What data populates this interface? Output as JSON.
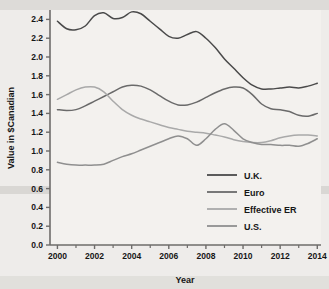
{
  "chart_data": {
    "type": "line",
    "title": "",
    "xlabel": "Year",
    "ylabel": "Value in $Canadian",
    "xlim": [
      1999.6,
      2014.2
    ],
    "ylim": [
      0.0,
      2.5
    ],
    "grid": false,
    "legend_position": "inside-bottom-right",
    "y_ticks": [
      "0.0",
      "0.2",
      "0.4",
      "0.6",
      "0.8",
      "1.0",
      "1.2",
      "1.4",
      "1.6",
      "1.8",
      "2.0",
      "2.2",
      "2.4"
    ],
    "y_tick_values": [
      0.0,
      0.2,
      0.4,
      0.6,
      0.8,
      1.0,
      1.2,
      1.4,
      1.6,
      1.8,
      2.0,
      2.2,
      2.4
    ],
    "x_ticks": [
      "2000",
      "2002",
      "2004",
      "2006",
      "2008",
      "2010",
      "2012",
      "2014"
    ],
    "x_tick_values": [
      2000,
      2002,
      2004,
      2006,
      2008,
      2010,
      2012,
      2014
    ],
    "x_minor_tick_values": [
      2001,
      2003,
      2005,
      2007,
      2009,
      2011,
      2013
    ],
    "x": [
      2000,
      2000.5,
      2001,
      2001.5,
      2002,
      2002.5,
      2003,
      2003.5,
      2004,
      2004.5,
      2005,
      2005.5,
      2006,
      2006.5,
      2007,
      2007.5,
      2008,
      2008.5,
      2009,
      2009.5,
      2010,
      2010.5,
      2011,
      2011.5,
      2012,
      2012.5,
      2013,
      2013.5,
      2014
    ],
    "series": [
      {
        "name": "U.K.",
        "color": "#4a4a4a",
        "values": [
          2.38,
          2.3,
          2.29,
          2.33,
          2.44,
          2.47,
          2.41,
          2.42,
          2.48,
          2.46,
          2.38,
          2.3,
          2.22,
          2.2,
          2.24,
          2.27,
          2.2,
          2.1,
          1.98,
          1.88,
          1.78,
          1.7,
          1.66,
          1.66,
          1.67,
          1.68,
          1.67,
          1.69,
          1.72
        ]
      },
      {
        "name": "Euro",
        "color": "#6a6a6a",
        "values": [
          1.44,
          1.43,
          1.44,
          1.48,
          1.53,
          1.58,
          1.63,
          1.68,
          1.7,
          1.69,
          1.65,
          1.59,
          1.53,
          1.49,
          1.49,
          1.52,
          1.57,
          1.62,
          1.66,
          1.68,
          1.67,
          1.6,
          1.5,
          1.45,
          1.44,
          1.42,
          1.38,
          1.37,
          1.4
        ]
      },
      {
        "name": "Effective ER",
        "color": "#a9a9a9",
        "values": [
          1.55,
          1.6,
          1.65,
          1.68,
          1.68,
          1.63,
          1.53,
          1.44,
          1.38,
          1.34,
          1.31,
          1.28,
          1.25,
          1.23,
          1.21,
          1.2,
          1.19,
          1.17,
          1.15,
          1.12,
          1.1,
          1.09,
          1.09,
          1.11,
          1.14,
          1.16,
          1.17,
          1.17,
          1.16
        ]
      },
      {
        "name": "U.S.",
        "color": "#8f8f8f",
        "values": [
          0.88,
          0.86,
          0.85,
          0.85,
          0.85,
          0.86,
          0.9,
          0.94,
          0.97,
          1.01,
          1.05,
          1.09,
          1.13,
          1.16,
          1.13,
          1.06,
          1.13,
          1.23,
          1.29,
          1.22,
          1.13,
          1.09,
          1.07,
          1.07,
          1.06,
          1.06,
          1.05,
          1.08,
          1.13
        ]
      }
    ]
  },
  "legend": {
    "items": [
      {
        "label": "U.K."
      },
      {
        "label": "Euro"
      },
      {
        "label": "Effective ER"
      },
      {
        "label": "U.S."
      }
    ]
  },
  "axes": {
    "x_title": "Year",
    "y_title": "Value in $Canadian"
  },
  "colors": {
    "background": "#eeecea",
    "plot_background": "#f3f1ee",
    "axis": "#6e6c6a",
    "text": "#161616"
  }
}
